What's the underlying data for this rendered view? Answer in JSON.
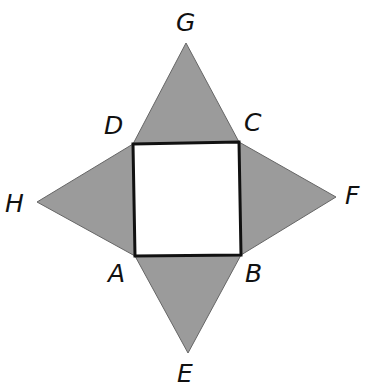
{
  "diagram": {
    "type": "geometry-net",
    "colors": {
      "triangle_fill": "#9b9b9b",
      "square_fill": "#ffffff",
      "stroke": "#111111"
    },
    "points": {
      "A": [
        135,
        256
      ],
      "B": [
        241,
        255
      ],
      "C": [
        239,
        142
      ],
      "D": [
        133,
        144
      ],
      "E": [
        188,
        353
      ],
      "F": [
        336,
        197
      ],
      "G": [
        186,
        43
      ],
      "H": [
        37,
        202
      ]
    },
    "labels": [
      {
        "id": "G",
        "text": "G",
        "x": 176,
        "y": 10
      },
      {
        "id": "D",
        "text": "D",
        "x": 104,
        "y": 113
      },
      {
        "id": "C",
        "text": "C",
        "x": 244,
        "y": 110
      },
      {
        "id": "H",
        "text": "H",
        "x": 5,
        "y": 191
      },
      {
        "id": "F",
        "text": "F",
        "x": 345,
        "y": 183
      },
      {
        "id": "A",
        "text": "A",
        "x": 108,
        "y": 261
      },
      {
        "id": "B",
        "text": "B",
        "x": 245,
        "y": 261
      },
      {
        "id": "E",
        "text": "E",
        "x": 177,
        "y": 361
      }
    ]
  }
}
